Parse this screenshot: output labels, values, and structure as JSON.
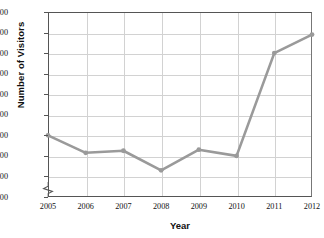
{
  "chart_data": {
    "type": "line",
    "title": "",
    "xlabel": "Year",
    "ylabel": "Number of Visitors",
    "categories": [
      "2005",
      "2006",
      "2007",
      "2008",
      "2009",
      "2010",
      "2011",
      "2012"
    ],
    "x": [
      2005,
      2006,
      2007,
      2008,
      2009,
      2010,
      2011,
      2012
    ],
    "values": [
      36000,
      34300,
      34500,
      32600,
      34600,
      34000,
      44000,
      45800
    ],
    "series": [
      {
        "name": "Number of Visitors",
        "values": [
          36000,
          34300,
          34500,
          32600,
          34600,
          34000,
          44000,
          45800
        ]
      }
    ],
    "ylim": [
      30000,
      48000
    ],
    "ytick_labels": [
      "48,000",
      "46,000",
      "44,000",
      "42,000",
      "40,000",
      "38,000",
      "36,000",
      "34,000",
      "32,000",
      "30,000"
    ],
    "ytick_values": [
      48000,
      46000,
      44000,
      42000,
      40000,
      38000,
      36000,
      34000,
      32000,
      30000
    ],
    "ytick_step": 2000,
    "grid": true,
    "legend": "none",
    "axis_break": true,
    "axis_break_note": "y-axis broken below 30,000",
    "line_color": "#9a9a9a",
    "marker_color": "#9a9a9a",
    "grid_color": "#d2d2d2",
    "axis_color": "#555555",
    "background_color": "#ffffff"
  }
}
